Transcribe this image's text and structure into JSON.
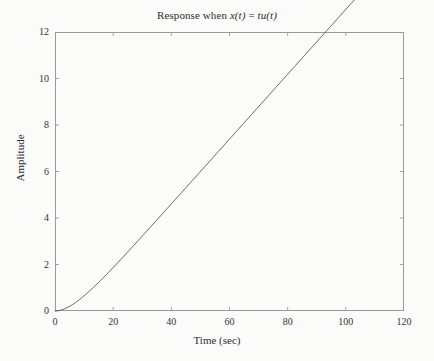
{
  "chart_data": {
    "type": "line",
    "title": "Response when x(t) = tu(t)",
    "title_prefix": "Response when ",
    "title_var_x": "x",
    "title_paren_t1": "(t)",
    "title_equals": " = ",
    "title_var_tu": "tu",
    "title_paren_t2": "(t)",
    "xlabel": "Time (sec)",
    "ylabel": "Amplitude",
    "xlim": [
      0,
      120
    ],
    "ylim": [
      0,
      12
    ],
    "xticks": [
      0,
      20,
      40,
      60,
      80,
      100,
      120
    ],
    "yticks": [
      0,
      2,
      4,
      6,
      8,
      10,
      12
    ],
    "xtick_labels": [
      "0",
      "20",
      "40",
      "60",
      "80",
      "100",
      "120"
    ],
    "ytick_labels": [
      "0",
      "2",
      "4",
      "6",
      "8",
      "10",
      "12"
    ],
    "grid": false,
    "legend": false,
    "line_color": "#4a4a4a",
    "frame_color": "#9a9a9a",
    "series": [
      {
        "name": "ramp response",
        "x": [
          0,
          1,
          2,
          3,
          4,
          5,
          6,
          7,
          8,
          9,
          10,
          12,
          14,
          16,
          18,
          20,
          24,
          28,
          32,
          36,
          40,
          45,
          50,
          55,
          60,
          65,
          70,
          75,
          80,
          85,
          90,
          95,
          100,
          104,
          108
        ],
        "y": [
          0,
          0.07,
          0.26,
          0.55,
          0.93,
          1.38,
          1.89,
          2.45,
          3.05,
          3.68,
          4.33,
          5.69,
          7.1,
          8.54,
          10.0,
          11.47,
          14.43,
          17.42,
          20.41,
          23.41,
          26.41,
          30.16,
          33.91,
          37.66,
          41.41,
          45.16,
          48.91,
          52.66,
          56.41,
          60.16,
          63.91,
          67.66,
          71.41,
          74.41,
          77.41
        ]
      }
    ],
    "y_scale_note": "plotted amplitude = 0.1408 x modelled ramp",
    "plotted_points": [
      [
        0,
        0.0
      ],
      [
        2,
        0.0
      ],
      [
        4,
        0.02
      ],
      [
        6,
        0.07
      ],
      [
        8,
        0.15
      ],
      [
        10,
        0.28
      ],
      [
        14,
        0.63
      ],
      [
        18,
        1.08
      ],
      [
        22,
        1.58
      ],
      [
        26,
        2.11
      ],
      [
        30,
        2.65
      ],
      [
        34,
        3.2
      ],
      [
        38,
        3.75
      ],
      [
        42,
        4.3
      ],
      [
        46,
        4.86
      ],
      [
        50,
        5.42
      ],
      [
        56,
        6.25
      ],
      [
        62,
        7.08
      ],
      [
        68,
        7.92
      ],
      [
        74,
        8.75
      ],
      [
        80,
        9.58
      ],
      [
        86,
        10.42
      ],
      [
        92,
        11.25
      ],
      [
        98,
        12.08
      ],
      [
        104,
        12.92
      ],
      [
        108,
        13.48
      ]
    ]
  },
  "curve_model": {
    "tau": 7.0,
    "slope": 0.1395,
    "t_start": 0,
    "t_end": 108,
    "description": "y = k * (t - tau*(1 - exp(-t/tau)))"
  }
}
